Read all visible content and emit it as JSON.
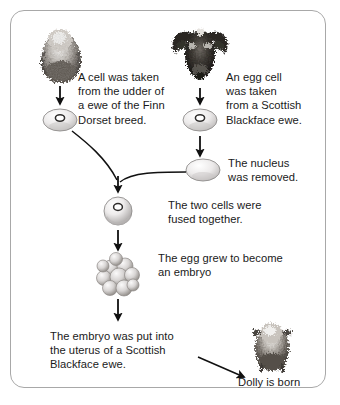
{
  "diagram": {
    "background_color": "#ffffff",
    "border_color": "#a8a8a8",
    "text_color": "#1a1a1a",
    "steps": [
      {
        "id": "somatic-cell",
        "caption": "A cell was taken\nfrom the udder of\na ewe of the Finn\nDorset breed."
      },
      {
        "id": "egg-cell",
        "caption": "An egg cell\nwas taken\nfrom a Scottish\nBlackface ewe."
      },
      {
        "id": "enucleation",
        "caption": "The nucleus\nwas removed."
      },
      {
        "id": "fusion",
        "caption": "The two cells were\nfused together."
      },
      {
        "id": "embryo-growth",
        "caption": "The egg grew to become\nan embryo"
      },
      {
        "id": "implantation",
        "caption": "The embryo was put into\nthe uterus of a Scottish\nBlackface ewe."
      },
      {
        "id": "birth",
        "caption": "Dolly is born"
      }
    ],
    "images": [
      {
        "id": "finn-dorset-ewe-photo",
        "label": "Finn Dorset ewe photograph"
      },
      {
        "id": "scottish-blackface-ewe-photo",
        "label": "Scottish Blackface ewe head photograph"
      },
      {
        "id": "dolly-lamb-photo",
        "label": "Dolly the lamb photograph"
      }
    ],
    "cells": [
      {
        "id": "udder-cell",
        "label": "udder cell with nucleus"
      },
      {
        "id": "egg-cell-with-nucleus",
        "label": "egg cell with nucleus"
      },
      {
        "id": "egg-cell-enucleated",
        "label": "egg cell without nucleus"
      },
      {
        "id": "fused-cell",
        "label": "fused cell with nucleus"
      },
      {
        "id": "embryo-morula",
        "label": "embryo cell cluster"
      }
    ]
  }
}
